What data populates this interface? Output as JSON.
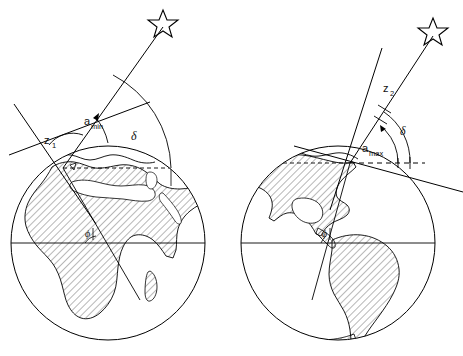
{
  "figure": {
    "type": "astronomical-diagram",
    "background_color": "#ffffff",
    "ink_color": "#000000",
    "hatch_color": "#555555"
  },
  "globes": [
    {
      "id": "left-globe",
      "region_name": "Africa and Europe",
      "center": {
        "x": 108,
        "y": 243
      },
      "radius": 97,
      "equator_label": "",
      "shading": "hatched-northern-and-eastern-hemisphere",
      "observer": {
        "x": 63,
        "y": 168
      },
      "labels": {
        "zenith_distance": "z",
        "zenith_distance_sub": "1",
        "altitude": "a",
        "altitude_sub": "min",
        "declination": "δ",
        "latitude": "ϕ"
      }
    },
    {
      "id": "right-globe",
      "region_name": "North and South America",
      "center": {
        "x": 338,
        "y": 243
      },
      "radius": 97,
      "equator_label": "",
      "shading": "hatched-land-masses",
      "observer": {
        "x": 350,
        "y": 163
      },
      "labels": {
        "zenith_distance": "z",
        "zenith_distance_sub": "2",
        "altitude": "a",
        "altitude_sub": "max",
        "declination": "δ",
        "latitude": "ϕ"
      }
    }
  ],
  "stars": [
    {
      "id": "left-star",
      "x": 163,
      "y": 22,
      "name": "star-symbol"
    },
    {
      "id": "right-star",
      "x": 433,
      "y": 30,
      "name": "star-symbol"
    }
  ],
  "annotations": {
    "left": {
      "z1_label": "z",
      "z1_subscript": "1",
      "amin_label": "a",
      "amin_subscript": "min",
      "delta_label": "δ",
      "phi_label": "ϕ"
    },
    "right": {
      "z2_label": "z",
      "z2_subscript": "2",
      "amax_label": "a",
      "amax_subscript": "max",
      "delta_label": "δ",
      "phi_label": "ϕ"
    }
  }
}
